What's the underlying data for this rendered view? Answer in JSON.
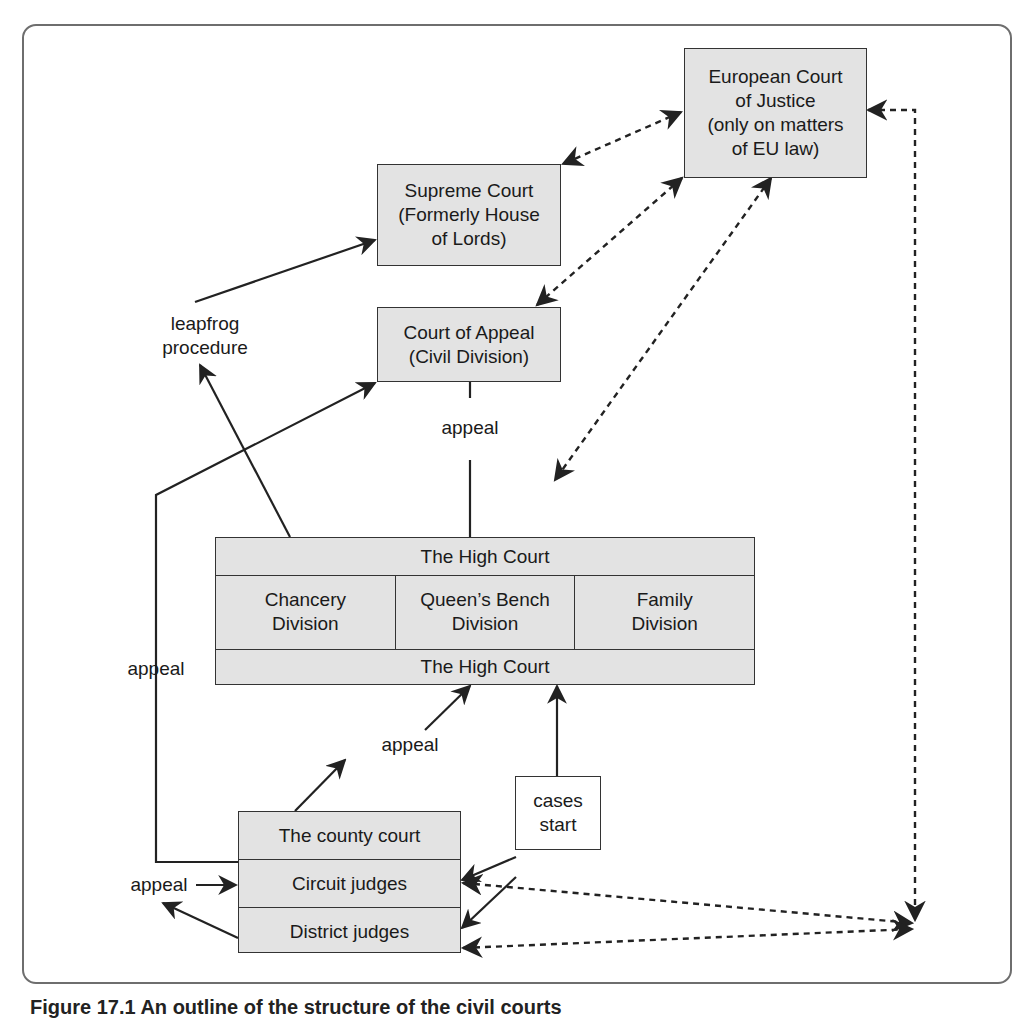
{
  "diagram": {
    "title": "Outline of the structure of the civil courts",
    "nodes": {
      "ecj": "European Court\nof Justice\n(only on matters\nof EU law)",
      "supreme": "Supreme Court\n(Formerly House\nof Lords)",
      "appeal_court": "Court of Appeal\n(Civil Division)",
      "high_court_top": "The High Court",
      "high_court_bottom": "The High Court",
      "divisions": [
        "Chancery\nDivision",
        "Queen’s Bench\nDivision",
        "Family\nDivision"
      ],
      "county_court": [
        "The county court",
        "Circuit judges",
        "District judges"
      ],
      "cases_start": "cases\nstart"
    },
    "labels": {
      "leapfrog": "leapfrog\nprocedure",
      "appeal_high_to_ca": "appeal",
      "appeal_left": "appeal",
      "appeal_county_to_high": "appeal",
      "appeal_district": "appeal"
    },
    "edges": [
      {
        "from": "high_court",
        "to": "appeal_court",
        "style": "solid",
        "label": "appeal"
      },
      {
        "from": "county_court",
        "to": "appeal_court",
        "style": "solid",
        "label": "appeal"
      },
      {
        "from": "high_court",
        "to": "supreme",
        "style": "solid",
        "label": "leapfrog procedure"
      },
      {
        "from": "county_court",
        "to": "high_court",
        "style": "solid",
        "label": "appeal"
      },
      {
        "from": "cases_start",
        "to": "high_court",
        "style": "solid"
      },
      {
        "from": "cases_start",
        "to": "county_court",
        "style": "solid"
      },
      {
        "from": "cases_start",
        "to": "circuit_judges",
        "style": "solid"
      },
      {
        "from": "district_judges",
        "to": "circuit_judges",
        "style": "solid",
        "label": "appeal"
      },
      {
        "from": "ecj",
        "to": "supreme",
        "style": "dashed",
        "bidirectional": true
      },
      {
        "from": "ecj",
        "to": "appeal_court",
        "style": "dashed",
        "bidirectional": true
      },
      {
        "from": "ecj",
        "to": "high_court",
        "style": "dashed",
        "bidirectional": true
      },
      {
        "from": "ecj",
        "to": "circuit_judges",
        "style": "dashed",
        "bidirectional": true
      },
      {
        "from": "ecj",
        "to": "district_judges",
        "style": "dashed",
        "bidirectional": true
      }
    ],
    "colors": {
      "box_fill": "#e3e3e3",
      "stroke": "#333333",
      "frame": "#6e6e6e"
    }
  },
  "caption": "Figure 17.1 An outline of the structure of the civil courts"
}
